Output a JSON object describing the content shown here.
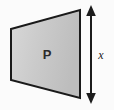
{
  "figure": {
    "background_color": "#fbfbfb",
    "shape": {
      "name": "trapezoid",
      "label": "P",
      "fill_color_light": "#d6d6d6",
      "fill_color_dark": "#c0c0c0",
      "outline_color": "#1a1a1a",
      "outline_width": 2,
      "vertices": [
        {
          "x": 11,
          "y": 29
        },
        {
          "x": 80,
          "y": 10
        },
        {
          "x": 80,
          "y": 98
        },
        {
          "x": 11,
          "y": 80
        }
      ]
    },
    "dimension": {
      "label": "x",
      "measures": "right-edge-height",
      "color": "#1c1c1c",
      "arrow_x": 91,
      "arrow_top_y": 6,
      "arrow_bottom_y": 103,
      "label_x": 101,
      "label_y": 59
    }
  }
}
